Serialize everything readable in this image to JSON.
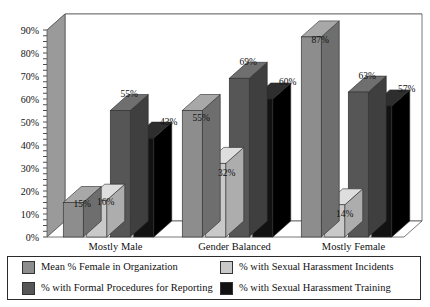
{
  "chart_data": {
    "type": "bar",
    "title": "",
    "subtitle": "",
    "xlabel": "",
    "ylabel": "",
    "ylim": [
      0,
      90
    ],
    "ytick_labels": [
      "0%",
      "10%",
      "20%",
      "30%",
      "40%",
      "50%",
      "60%",
      "70%",
      "80%",
      "90%"
    ],
    "ytick_values": [
      0,
      10,
      20,
      30,
      40,
      50,
      60,
      70,
      80,
      90
    ],
    "grid": true,
    "grid_axis": "y",
    "legend_position": "bottom",
    "three_d": true,
    "categories": [
      "Mostly Male",
      "Gender Balanced",
      "Mostly Female"
    ],
    "series": [
      {
        "name": "Mean % Female in Organization",
        "color": "#8d8d8d",
        "top_color": "#a8a8a8",
        "side_color": "#6e6e6e",
        "values": [
          15,
          55,
          87
        ],
        "labels": [
          "15%",
          "55%",
          "87%"
        ]
      },
      {
        "name": "% with Sexual Harassment Incidents",
        "color": "#c9c9c9",
        "top_color": "#dedede",
        "side_color": "#adadad",
        "values": [
          16,
          32,
          14
        ],
        "labels": [
          "16%",
          "32%",
          "14%"
        ]
      },
      {
        "name": "% with Formal Procedures for Reporting",
        "color": "#565656",
        "top_color": "#6f6f6f",
        "side_color": "#3f3f3f",
        "values": [
          55,
          69,
          63
        ],
        "labels": [
          "55%",
          "69%",
          "63%"
        ]
      },
      {
        "name": "% with Sexual Harassment Training",
        "color": "#121212",
        "top_color": "#2e2e2e",
        "side_color": "#000000",
        "values": [
          43,
          60,
          57
        ],
        "labels": [
          "43%",
          "60%",
          "57%"
        ]
      }
    ]
  },
  "axis": {
    "y_ticks": [
      "90%",
      "80%",
      "70%",
      "60%",
      "50%",
      "40%",
      "30%",
      "20%",
      "10%",
      "0%"
    ]
  },
  "categories": {
    "c0": "Mostly Male",
    "c1": "Gender Balanced",
    "c2": "Mostly Female"
  },
  "legend": {
    "items": [
      {
        "label": "Mean % Female in Organization",
        "color": "#8d8d8d"
      },
      {
        "label": "% with Sexual Harassment Incidents",
        "color": "#c9c9c9"
      },
      {
        "label": "% with Formal Procedures for Reporting",
        "color": "#565656"
      },
      {
        "label": "% with Sexual Harassment Training",
        "color": "#121212"
      }
    ]
  }
}
